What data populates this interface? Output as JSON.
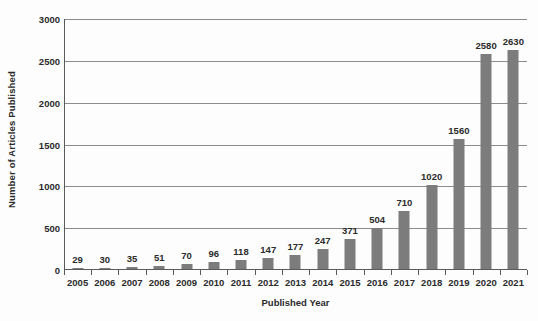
{
  "chart_data": {
    "type": "bar",
    "title": "",
    "xlabel": "Published Year",
    "ylabel": "Number of Articles Published",
    "categories": [
      "2005",
      "2006",
      "2007",
      "2008",
      "2009",
      "2010",
      "2011",
      "2012",
      "2013",
      "2014",
      "2015",
      "2016",
      "2017",
      "2018",
      "2019",
      "2020",
      "2021"
    ],
    "values": [
      29,
      30,
      35,
      51,
      70,
      96,
      118,
      147,
      177,
      247,
      371,
      504,
      710,
      1020,
      1560,
      2580,
      2630
    ],
    "value_labels": [
      "29",
      "30",
      "35",
      "51",
      "70",
      "96",
      "118",
      "147",
      "177",
      "247",
      "371",
      "504",
      "710",
      "1020",
      "1560",
      "2580",
      "2630"
    ],
    "ylim": [
      0,
      3000
    ],
    "yticks": [
      0,
      500,
      1000,
      1500,
      2000,
      2500,
      3000
    ],
    "ytick_labels": [
      "0",
      "500",
      "1000",
      "1500",
      "2000",
      "2500",
      "3000"
    ],
    "grid": true,
    "legend": false,
    "bar_color": "#7c7c7c",
    "gridline_color": "#8c8c8c",
    "axis_color": "#5a5a5a",
    "background_color": "#fdfdfd",
    "text_color": "#2b2b2b"
  }
}
